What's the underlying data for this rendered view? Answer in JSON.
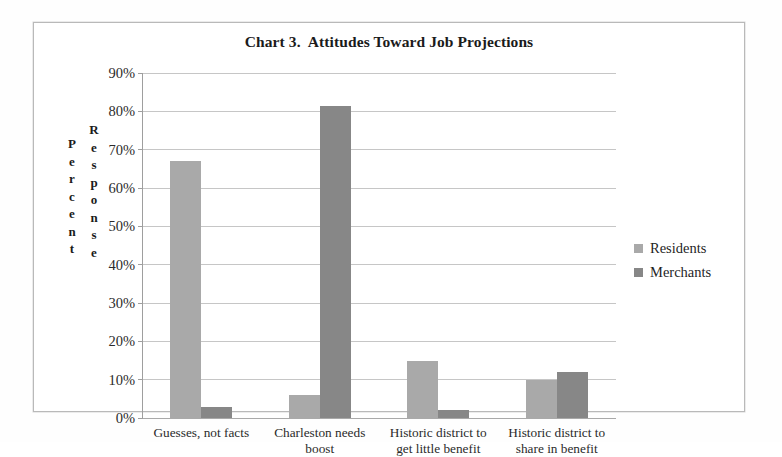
{
  "chart_data": {
    "type": "bar",
    "title": "Chart 3.  Attitudes Toward Job Projections",
    "xlabel": "",
    "ylabel": "Percent Response",
    "ylabel_stacked": [
      "Percent",
      "Response"
    ],
    "categories": [
      "Guesses, not facts",
      "Charleston needs boost",
      "Historic district to get little benefit",
      "Historic district to share in benefit"
    ],
    "category_lines": [
      [
        "Guesses, not facts"
      ],
      [
        "Charleston needs",
        "boost"
      ],
      [
        "Historic district to",
        "get little benefit"
      ],
      [
        "Historic district to",
        "share in benefit"
      ]
    ],
    "series": [
      {
        "name": "Residents",
        "color": "#a9a9a9",
        "values": [
          67,
          6,
          15,
          10
        ]
      },
      {
        "name": "Merchants",
        "color": "#878787",
        "values": [
          3,
          81.5,
          2,
          12
        ]
      }
    ],
    "ylim": [
      0,
      90
    ],
    "ytick_values": [
      0,
      10,
      20,
      30,
      40,
      50,
      60,
      70,
      80,
      90
    ],
    "ytick_labels": [
      "0%",
      "10%",
      "20%",
      "30%",
      "40%",
      "50%",
      "60%",
      "70%",
      "80%",
      "90%"
    ],
    "grid": true,
    "grid_axis": "y",
    "legend_position": "right",
    "value_unit": "%"
  },
  "legend": {
    "items": [
      {
        "label": "Residents",
        "color": "#a9a9a9"
      },
      {
        "label": "Merchants",
        "color": "#878787"
      }
    ]
  },
  "colors": {
    "residents": "#a9a9a9",
    "merchants": "#878787",
    "gridline": "#c6c6c6",
    "axis": "#9e9e9e",
    "frame": "#b9b9b9",
    "text": "#231f20",
    "background": "#ffffff"
  }
}
